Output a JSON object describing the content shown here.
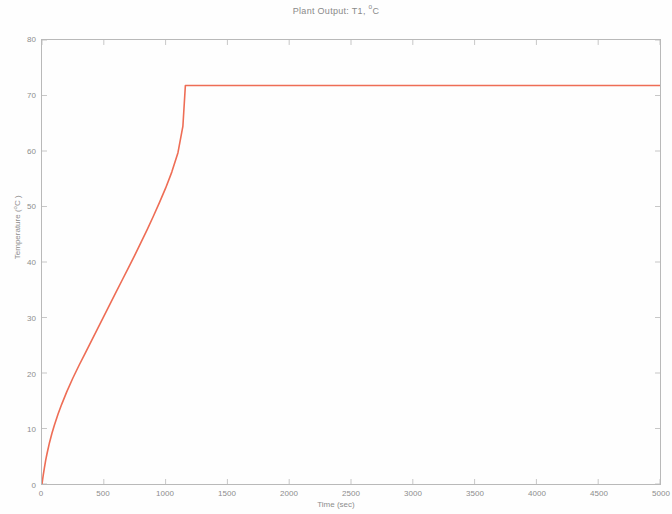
{
  "figure": {
    "background_color": "#ffffff",
    "frame_color": "#b9b9b9",
    "text_color": "#8d8d8d"
  },
  "title": {
    "prefix": "Plant Output:  T1, ",
    "degree": "o",
    "unit": "C",
    "full": "Plant Output:  T1, oC"
  },
  "yaxis": {
    "label_prefix": "Temperature (",
    "label_degree": "o",
    "label_suffix": "C )",
    "label_full": "Temperature ( oC )",
    "ticks": [
      "0",
      "10",
      "20",
      "30",
      "40",
      "50",
      "60",
      "70",
      "80"
    ]
  },
  "xaxis": {
    "label": "Time (sec)",
    "ticks": [
      "0",
      "500",
      "1000",
      "1500",
      "2000",
      "2500",
      "3000",
      "3500",
      "4000",
      "4500",
      "5000"
    ]
  },
  "chart_data": {
    "type": "line",
    "title": "Plant Output:  T1, oC",
    "xlabel": "Time (sec)",
    "ylabel": "Temperature ( oC )",
    "xlim": [
      0,
      5000
    ],
    "ylim": [
      0,
      80
    ],
    "xticks": [
      0,
      500,
      1000,
      1500,
      2000,
      2500,
      3000,
      3500,
      4000,
      4500,
      5000
    ],
    "yticks": [
      0,
      10,
      20,
      30,
      40,
      50,
      60,
      70,
      80
    ],
    "grid": false,
    "legend": null,
    "series": [
      {
        "name": "T1",
        "color": "#ee6d55",
        "line_width": 1.6,
        "x": [
          0,
          10,
          20,
          30,
          40,
          60,
          80,
          100,
          130,
          160,
          200,
          250,
          300,
          350,
          400,
          450,
          500,
          550,
          600,
          650,
          700,
          750,
          800,
          850,
          900,
          950,
          1000,
          1050,
          1100,
          1140,
          1160,
          1300,
          1600,
          2000,
          2500,
          3000,
          3500,
          4000,
          4500,
          5000
        ],
        "y": [
          0.0,
          1.6,
          3.0,
          4.3,
          5.4,
          7.4,
          9.1,
          10.6,
          12.6,
          14.4,
          16.6,
          19.1,
          21.4,
          23.6,
          25.8,
          28.0,
          30.2,
          32.4,
          34.6,
          36.8,
          39.0,
          41.2,
          43.5,
          45.8,
          48.2,
          50.7,
          53.3,
          56.2,
          59.7,
          64.5,
          71.8,
          71.8,
          71.8,
          71.8,
          71.8,
          71.8,
          71.8,
          71.8,
          71.8,
          71.8
        ],
        "steady_state_value": 71.8,
        "steady_state_start_x": 1150
      }
    ]
  }
}
